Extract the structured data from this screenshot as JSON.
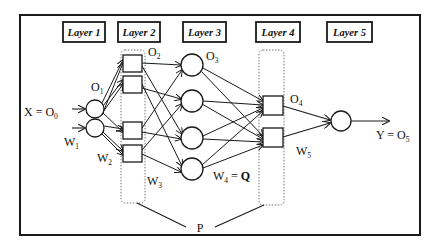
{
  "diagram": {
    "type": "neural-network-architecture",
    "colors": {
      "stroke": "#1a1a1a",
      "dotted": "#777777",
      "background": "#ffffff"
    },
    "layers": [
      {
        "id": 1,
        "label": "Layer 1",
        "node_shape": "circle",
        "node_count": 2
      },
      {
        "id": 2,
        "label": "Layer 2",
        "node_shape": "square",
        "node_count": 4,
        "grouped": true
      },
      {
        "id": 3,
        "label": "Layer 3",
        "node_shape": "circle",
        "node_count": 4
      },
      {
        "id": 4,
        "label": "Layer 4",
        "node_shape": "square",
        "node_count": 2,
        "grouped": true
      },
      {
        "id": 5,
        "label": "Layer 5",
        "node_shape": "circle",
        "node_count": 1
      }
    ],
    "annotations": {
      "input": {
        "main": "X = O",
        "sub": "0"
      },
      "o1": {
        "main": "O",
        "sub": "1"
      },
      "o2": {
        "main": "O",
        "sub": "2"
      },
      "o3": {
        "main": "O",
        "sub": "3"
      },
      "o4": {
        "main": "O",
        "sub": "4"
      },
      "output": {
        "main": "Y = O",
        "sub": "5"
      },
      "w1": {
        "main": "W",
        "sub": "1"
      },
      "w2": {
        "main": "W",
        "sub": "2"
      },
      "w3": {
        "main": "W",
        "sub": "3"
      },
      "w4": {
        "main": "W",
        "sub": "4",
        "suffix": " = ",
        "bold_suffix": "Q"
      },
      "w5": {
        "main": "W",
        "sub": "5"
      },
      "p": "P"
    }
  }
}
